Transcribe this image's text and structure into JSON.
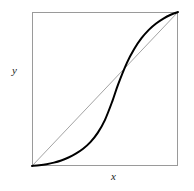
{
  "figure": {
    "kind": "math-plot",
    "background_color": "#ffffff",
    "frame": {
      "name": "plot-box",
      "x": 32,
      "y": 12,
      "width": 146,
      "height": 154,
      "stroke_color": "#9a9a9a",
      "stroke_width": 1
    },
    "labels": {
      "x_label": "x",
      "y_label": "y"
    }
  },
  "chart_data": {
    "type": "line",
    "title": "",
    "xlabel": "x",
    "ylabel": "y",
    "xlim": [
      0,
      1
    ],
    "ylim": [
      0,
      1
    ],
    "grid": false,
    "legend": "none",
    "axis_ticks": {
      "x": [],
      "y": []
    },
    "annotations": [
      "S-shaped (sigmoid) curve drawn against the 45-degree identity line inside a square frame",
      "Curve lies below the diagonal for small x (convex region) and above the diagonal for large x (concave region)",
      "Curve and diagonal coincide at the two corners (0,0) and (1,1) and cross once near the middle"
    ],
    "series": [
      {
        "name": "diagonal-identity-line",
        "style": "thin gray straight line",
        "color": "#8c8c8c",
        "width": 0.8,
        "x": [
          0.0,
          1.0
        ],
        "values": [
          0.0,
          1.0
        ]
      },
      {
        "name": "sigmoid-curve",
        "style": "thick black S-curve",
        "color": "#000000",
        "width": 2.0,
        "x": [
          0.0,
          0.05,
          0.1,
          0.15,
          0.2,
          0.25,
          0.3,
          0.35,
          0.4,
          0.45,
          0.5,
          0.55,
          0.59,
          0.65,
          0.7,
          0.75,
          0.8,
          0.85,
          0.9,
          0.95,
          1.0
        ],
        "values": [
          0.0,
          0.005,
          0.012,
          0.022,
          0.036,
          0.055,
          0.08,
          0.112,
          0.155,
          0.215,
          0.3,
          0.42,
          0.53,
          0.67,
          0.76,
          0.83,
          0.884,
          0.925,
          0.957,
          0.982,
          1.0
        ]
      }
    ],
    "crossing_point": {
      "x": 0.59,
      "y": 0.59,
      "note": "curve intersects the identity line once"
    }
  }
}
